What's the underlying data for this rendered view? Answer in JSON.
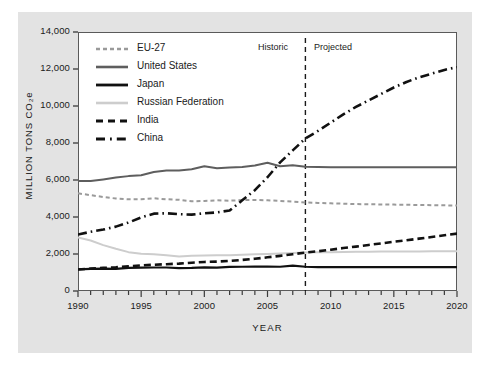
{
  "chart_data": {
    "type": "line",
    "title": "",
    "xlabel": "YEAR",
    "ylabel": "MILLION TONS CO₂e",
    "xlim": [
      1990,
      2020
    ],
    "ylim": [
      0,
      14000
    ],
    "ytick_labels": [
      "0",
      "2,000",
      "4,000",
      "6,000",
      "8,000",
      "10,000",
      "12,000",
      "14,000"
    ],
    "ytick_values": [
      0,
      2000,
      4000,
      6000,
      8000,
      10000,
      12000,
      14000
    ],
    "xtick_labels": [
      "1990",
      "1995",
      "2000",
      "2005",
      "2010",
      "2015",
      "2020"
    ],
    "xtick_values": [
      1990,
      1995,
      2000,
      2005,
      2010,
      2015,
      2020
    ],
    "minor_xticks_every": 1,
    "grid": false,
    "legend_position": "top-left-inside",
    "annotations": [
      {
        "text": "Historic",
        "x": 2006.6,
        "y": 13300
      },
      {
        "text": "Projected",
        "x": 2009.4,
        "y": 13300
      }
    ],
    "divider": {
      "x": 2008,
      "style": "dashed",
      "color": "#1a1a1a",
      "label_left": "Historic",
      "label_right": "Projected"
    },
    "x": [
      1990,
      1991,
      1992,
      1993,
      1994,
      1995,
      1996,
      1997,
      1998,
      1999,
      2000,
      2001,
      2002,
      2003,
      2004,
      2005,
      2006,
      2007,
      2008,
      2009,
      2010,
      2011,
      2012,
      2013,
      2014,
      2015,
      2016,
      2017,
      2018,
      2019,
      2020
    ],
    "series": [
      {
        "name": "EU-27",
        "color": "#9a9a9a",
        "style": "dotted",
        "values": [
          5280,
          5180,
          5080,
          5000,
          4960,
          4960,
          5010,
          4960,
          4930,
          4850,
          4870,
          4900,
          4880,
          4920,
          4920,
          4900,
          4870,
          4830,
          4790,
          4760,
          4740,
          4720,
          4700,
          4690,
          4680,
          4670,
          4660,
          4650,
          4640,
          4630,
          4620
        ]
      },
      {
        "name": "United States",
        "color": "#5e5e5e",
        "style": "solid",
        "values": [
          5950,
          5940,
          6030,
          6130,
          6210,
          6260,
          6430,
          6510,
          6520,
          6580,
          6740,
          6630,
          6680,
          6700,
          6780,
          6930,
          6740,
          6800,
          6720,
          6700,
          6690,
          6690,
          6690,
          6690,
          6690,
          6690,
          6690,
          6690,
          6690,
          6690,
          6690
        ]
      },
      {
        "name": "Japan",
        "color": "#111111",
        "style": "solid",
        "values": [
          1170,
          1200,
          1210,
          1200,
          1250,
          1260,
          1270,
          1270,
          1240,
          1250,
          1280,
          1260,
          1300,
          1310,
          1320,
          1320,
          1310,
          1370,
          1310,
          1290,
          1290,
          1290,
          1290,
          1290,
          1290,
          1290,
          1290,
          1290,
          1290,
          1290,
          1290
        ]
      },
      {
        "name": "Russian Federation",
        "color": "#cdcdcd",
        "style": "solid",
        "values": [
          2900,
          2730,
          2480,
          2280,
          2100,
          2010,
          1980,
          1930,
          1870,
          1900,
          1920,
          1930,
          1930,
          1960,
          1980,
          2000,
          2030,
          2060,
          2080,
          2090,
          2100,
          2110,
          2120,
          2120,
          2130,
          2130,
          2140,
          2140,
          2150,
          2150,
          2150
        ]
      },
      {
        "name": "India",
        "color": "#111111",
        "style": "dashed",
        "values": [
          1160,
          1210,
          1250,
          1280,
          1330,
          1380,
          1420,
          1450,
          1480,
          1530,
          1570,
          1590,
          1630,
          1680,
          1740,
          1820,
          1900,
          1990,
          2080,
          2150,
          2230,
          2320,
          2400,
          2490,
          2570,
          2660,
          2740,
          2830,
          2920,
          3010,
          3100
        ]
      },
      {
        "name": "China",
        "color": "#111111",
        "style": "dash-dot",
        "values": [
          3050,
          3200,
          3320,
          3480,
          3700,
          3980,
          4180,
          4200,
          4150,
          4130,
          4200,
          4250,
          4350,
          4900,
          5450,
          6150,
          6950,
          7600,
          8250,
          8650,
          9100,
          9550,
          9950,
          10300,
          10650,
          11000,
          11300,
          11550,
          11750,
          11950,
          12100
        ]
      }
    ]
  },
  "axes": {
    "y_title": "MILLION TONS CO₂e",
    "x_title": "YEAR"
  },
  "legend": {
    "items": [
      {
        "label": "EU-27",
        "style": "dotted",
        "color": "#9a9a9a"
      },
      {
        "label": "United States",
        "style": "solid",
        "color": "#5e5e5e"
      },
      {
        "label": "Japan",
        "style": "solid",
        "color": "#111111"
      },
      {
        "label": "Russian Federation",
        "style": "solid",
        "color": "#cdcdcd"
      },
      {
        "label": "India",
        "style": "dashed",
        "color": "#111111"
      },
      {
        "label": "China",
        "style": "dash-dot",
        "color": "#111111"
      }
    ]
  }
}
